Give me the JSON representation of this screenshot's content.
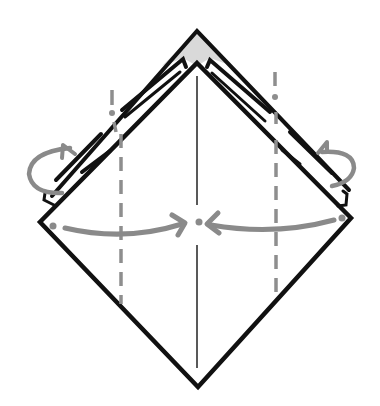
{
  "diagram": {
    "type": "origami-fold-step",
    "colors": {
      "ink": "#111111",
      "guide": "#8a8a8a",
      "shade": "#d9d9d9",
      "background": "#ffffff"
    },
    "symbols": [
      {
        "name": "valley-fold-left",
        "kind": "dashed-line"
      },
      {
        "name": "valley-fold-right",
        "kind": "dashed-line"
      },
      {
        "name": "mountain-fold-left",
        "kind": "dash-dot-line"
      },
      {
        "name": "mountain-fold-right",
        "kind": "dash-dot-line"
      },
      {
        "name": "arrow-left-to-center",
        "kind": "fold-arrow"
      },
      {
        "name": "arrow-right-to-center",
        "kind": "fold-arrow"
      },
      {
        "name": "turn-back-left",
        "kind": "loop-arrow"
      },
      {
        "name": "turn-back-right",
        "kind": "loop-arrow"
      },
      {
        "name": "center-crease",
        "kind": "crease-line"
      }
    ]
  }
}
